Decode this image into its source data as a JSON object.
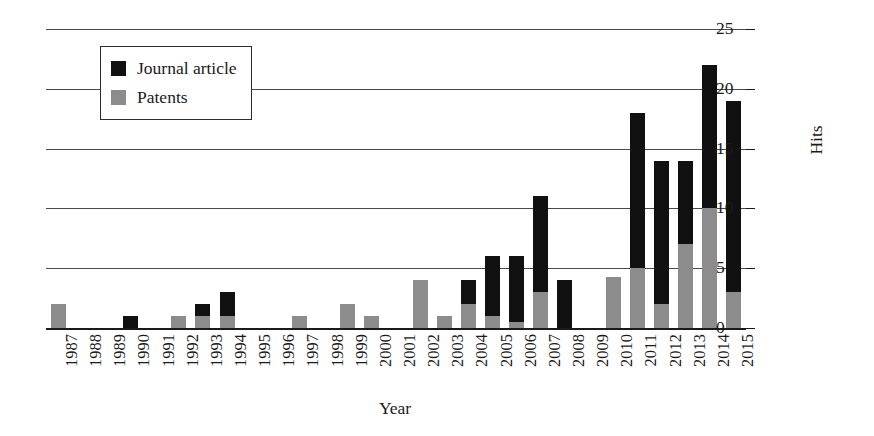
{
  "chart_data": {
    "type": "bar",
    "stacked": true,
    "title": "",
    "xlabel": "Year",
    "ylabel": "Hits",
    "ylim": [
      0,
      25
    ],
    "yticks": [
      0,
      5,
      10,
      15,
      20,
      25
    ],
    "grid": true,
    "legend_position": "top-left",
    "categories": [
      "1987",
      "1988",
      "1989",
      "1990",
      "1991",
      "1992",
      "1993",
      "1994",
      "1995",
      "1996",
      "1997",
      "1998",
      "1999",
      "2000",
      "2001",
      "2002",
      "2003",
      "2004",
      "2005",
      "2006",
      "2007",
      "2008",
      "2009",
      "2010",
      "2011",
      "2012",
      "2013",
      "2014",
      "2015"
    ],
    "series": [
      {
        "name": "Patents",
        "color": "#8c8c8c",
        "values": [
          2,
          0,
          0,
          0,
          0,
          1,
          1,
          1,
          0,
          0,
          1,
          0,
          2,
          1,
          0,
          4,
          1,
          2,
          1,
          0.5,
          3,
          0,
          0,
          4.3,
          5,
          2,
          7,
          10,
          3
        ]
      },
      {
        "name": "Journal article",
        "color": "#111111",
        "values": [
          0,
          0,
          0,
          1,
          0,
          0,
          1,
          2,
          0,
          0,
          0,
          0,
          0,
          0,
          0,
          0,
          0,
          2,
          5,
          5.5,
          8,
          4,
          0,
          0,
          13,
          12,
          7,
          12,
          16
        ]
      }
    ],
    "totals": [
      2,
      0,
      0,
      1,
      0,
      1,
      2,
      3,
      0,
      0,
      1,
      0,
      2,
      1,
      0,
      4,
      1,
      4,
      6,
      6,
      11,
      4,
      0,
      4.3,
      18,
      14,
      14,
      22,
      19
    ]
  },
  "legend": {
    "items": [
      {
        "label": "Journal article",
        "color": "#111111",
        "swatch_name": "legend-swatch-journal-article"
      },
      {
        "label": "Patents",
        "color": "#8c8c8c",
        "swatch_name": "legend-swatch-patents"
      }
    ]
  },
  "axes": {
    "x_title": "Year",
    "y_title": "Hits",
    "y_tick_labels": [
      "0",
      "5",
      "10",
      "15",
      "20",
      "25"
    ],
    "x_tick_labels": [
      "1987",
      "1988",
      "1989",
      "1990",
      "1991",
      "1992",
      "1993",
      "1994",
      "1995",
      "1996",
      "1997",
      "1998",
      "1999",
      "2000",
      "2001",
      "2002",
      "2003",
      "2004",
      "2005",
      "2006",
      "2007",
      "2008",
      "2009",
      "2010",
      "2011",
      "2012",
      "2013",
      "2014",
      "2015"
    ]
  }
}
